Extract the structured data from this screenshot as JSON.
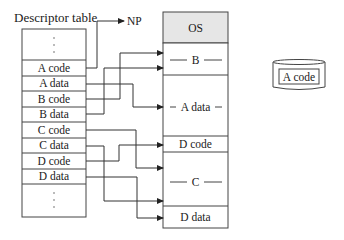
{
  "diagram": {
    "table_title": "Descriptor table",
    "table_rows": [
      {
        "label": "A code",
        "target": "np"
      },
      {
        "label": "A data",
        "target": "A data"
      },
      {
        "label": "B code",
        "target": "B-top"
      },
      {
        "label": "B data",
        "target": "B-bottom"
      },
      {
        "label": "C code",
        "target": "C-top"
      },
      {
        "label": "C data",
        "target": "C-bottom"
      },
      {
        "label": "D code",
        "target": "D code"
      },
      {
        "label": "D data",
        "target": "D data"
      }
    ],
    "np_label": "NP",
    "memory_regions": [
      {
        "label": "OS",
        "shaded": true
      },
      {
        "label": "B",
        "shaded": false
      },
      {
        "label": "A data",
        "shaded": false
      },
      {
        "label": "D code",
        "shaded": false
      },
      {
        "label": "C",
        "shaded": false
      },
      {
        "label": "D data",
        "shaded": false
      }
    ],
    "disk_label": "A code",
    "colors": {
      "line": "#333333",
      "os_fill": "#e6e6e6",
      "background": "#ffffff"
    }
  }
}
